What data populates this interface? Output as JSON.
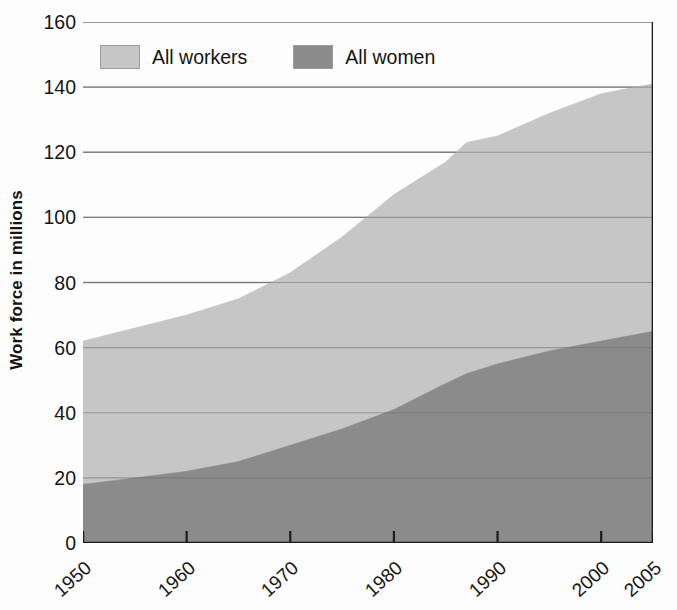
{
  "chart_data": {
    "type": "area",
    "title": "",
    "subtitle": "",
    "xlabel": "",
    "ylabel": "Work force in millions",
    "stacked": false,
    "grid": true,
    "grid_axis": "y",
    "legend_position": "inside-top-left",
    "xlim": [
      1950,
      2005
    ],
    "ylim": [
      0,
      160
    ],
    "yticks": [
      0,
      20,
      40,
      60,
      80,
      100,
      120,
      140,
      160
    ],
    "xticks": [
      1950,
      1960,
      1970,
      1980,
      1990,
      2000,
      2005
    ],
    "xtick_labels": [
      "1950",
      "1960",
      "1970",
      "1980",
      "1990",
      "2000",
      "2005"
    ],
    "ytick_labels": [
      "0",
      "20",
      "40",
      "60",
      "80",
      "100",
      "120",
      "140",
      "160"
    ],
    "x": [
      1950,
      1955,
      1960,
      1965,
      1970,
      1975,
      1980,
      1985,
      1987,
      1990,
      1995,
      2000,
      2005
    ],
    "series": [
      {
        "name": "All workers",
        "color": "#c6c6c6",
        "values": [
          62,
          66,
          70,
          75,
          83,
          94,
          107,
          117,
          123,
          125,
          132,
          138,
          141
        ]
      },
      {
        "name": "All women",
        "color": "#8b8b8b",
        "values": [
          18,
          20,
          22,
          25,
          30,
          35,
          41,
          49,
          52,
          55,
          59,
          62,
          65
        ]
      }
    ],
    "annotations": []
  },
  "axis": {
    "ylabel": "Work force in millions",
    "ytick_labels": [
      "160",
      "140",
      "120",
      "100",
      "80",
      "60",
      "40",
      "20",
      "0"
    ],
    "xtick_labels": [
      "1950",
      "1960",
      "1970",
      "1980",
      "1990",
      "2000",
      "2005"
    ]
  },
  "legend": {
    "entries": [
      {
        "label": "All workers",
        "color": "#c6c6c6"
      },
      {
        "label": "All women",
        "color": "#8b8b8b"
      }
    ]
  },
  "colors": {
    "all_workers": "#c6c6c6",
    "all_women": "#8b8b8b",
    "gridline": "#8d8d8d",
    "axis": "#1b1b1b",
    "background": "#fdfdfd",
    "text": "#141414"
  }
}
